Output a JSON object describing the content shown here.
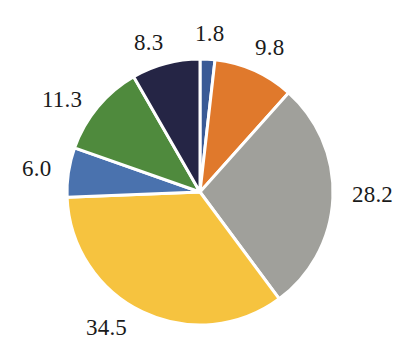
{
  "chart_data": {
    "type": "pie",
    "title": "",
    "subtitle": "",
    "xlabel": "",
    "ylabel": "",
    "grid": false,
    "legend": "none",
    "label_format": "value",
    "start_angle_deg": 0,
    "direction": "clockwise",
    "total": 99.9,
    "categories": [
      "Slice 1",
      "Slice 2",
      "Slice 3",
      "Slice 4",
      "Slice 5",
      "Slice 6",
      "Slice 7"
    ],
    "values": [
      1.8,
      9.8,
      28.2,
      34.5,
      6.0,
      11.3,
      8.3
    ],
    "labels": [
      "1.8",
      "9.8",
      "28.2",
      "34.5",
      "6.0",
      "11.3",
      "8.3"
    ],
    "colors": [
      "#3A5A96",
      "#E0792C",
      "#A0A09B",
      "#F6C33F",
      "#4A72AE",
      "#4F8A3D",
      "#252545"
    ],
    "slices": [
      {
        "label": "1.8",
        "value": 1.8,
        "color": "#3A5A96"
      },
      {
        "label": "9.8",
        "value": 9.8,
        "color": "#E0792C"
      },
      {
        "label": "28.2",
        "value": 28.2,
        "color": "#A0A09B"
      },
      {
        "label": "34.5",
        "value": 34.5,
        "color": "#F6C33F"
      },
      {
        "label": "6.0",
        "value": 6.0,
        "color": "#4A72AE"
      },
      {
        "label": "11.3",
        "value": 11.3,
        "color": "#4F8A3D"
      },
      {
        "label": "8.3",
        "value": 8.3,
        "color": "#252545"
      }
    ],
    "geometry": {
      "center_x": 200,
      "center_y": 192,
      "radius": 133,
      "separator_color": "#ffffff",
      "separator_width": 3
    },
    "background_color": "#ffffff",
    "label_color": "#1a1a1a"
  }
}
